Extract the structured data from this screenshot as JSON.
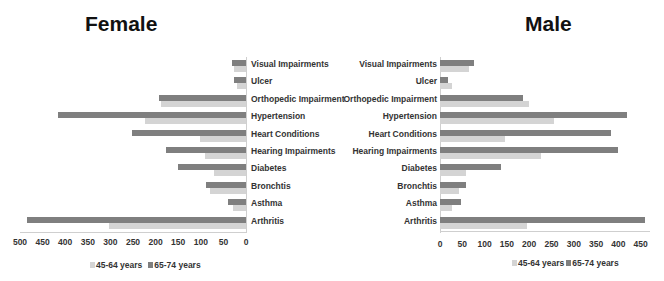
{
  "chart_data": [
    {
      "type": "bar",
      "orientation": "horizontal",
      "direction": "reversed",
      "title": "Female",
      "categories": [
        "Visual Impairments",
        "Ulcer",
        "Orthopedic Impairment",
        "Hypertension",
        "Heart Conditions",
        "Hearing Impairments",
        "Diabetes",
        "Bronchtis",
        "Asthma",
        "Arthritis"
      ],
      "series": [
        {
          "name": "45-64 years",
          "color": "#d4d4d4",
          "values": [
            27,
            20,
            189,
            223,
            102,
            91,
            71,
            80,
            29,
            304
          ]
        },
        {
          "name": "65-74 years",
          "color": "#7f7f7f",
          "values": [
            31,
            27,
            193,
            416,
            253,
            178,
            151,
            89,
            40,
            484
          ]
        }
      ],
      "xlim": [
        500,
        0
      ],
      "xticks": [
        "500",
        "450",
        "400",
        "350",
        "300",
        "250",
        "200",
        "150",
        "100",
        "50",
        "0"
      ],
      "legend_position": "bottom",
      "grid": false
    },
    {
      "type": "bar",
      "orientation": "horizontal",
      "title": "Male",
      "categories": [
        "Visual Impairments",
        "Ulcer",
        "Orthopedic Impairment",
        "Hypertension",
        "Heart Conditions",
        "Hearing Impairments",
        "Diabetes",
        "Bronchtis",
        "Asthma",
        "Arthritis"
      ],
      "series": [
        {
          "name": "45-64 years",
          "color": "#d4d4d4",
          "values": [
            65,
            27,
            200,
            256,
            146,
            226,
            58,
            43,
            27,
            195
          ]
        },
        {
          "name": "65-74 years",
          "color": "#7f7f7f",
          "values": [
            76,
            18,
            186,
            419,
            383,
            399,
            137,
            58,
            47,
            460
          ]
        }
      ],
      "xlim": [
        0,
        450
      ],
      "xticks": [
        "0",
        "50",
        "100",
        "150",
        "200",
        "250",
        "300",
        "350",
        "400",
        "450"
      ],
      "legend_position": "bottom",
      "grid": false
    }
  ]
}
